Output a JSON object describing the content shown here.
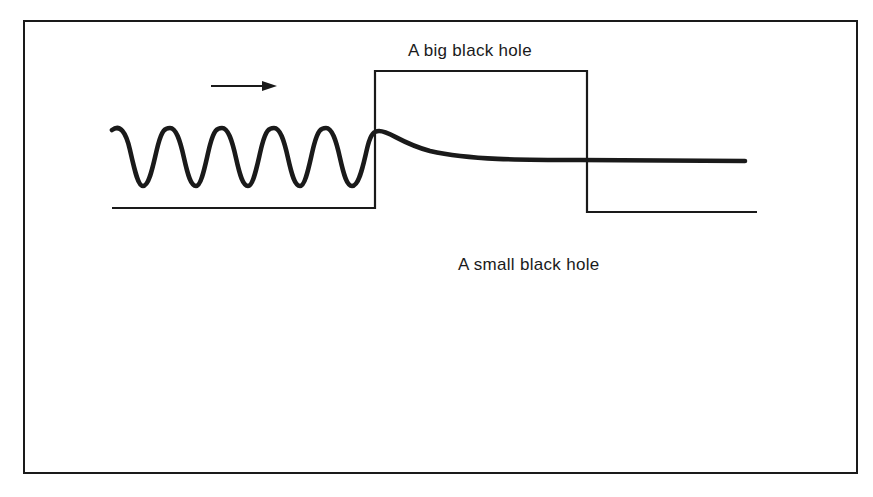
{
  "figure": {
    "type": "diagram",
    "colors": {
      "ink": "#1a1a1a",
      "background": "#ffffff"
    },
    "panels": [
      {
        "id": "big",
        "label": "A big black hole",
        "incoming_arrow": "right-arrow",
        "transmitted_arrow": null,
        "barrier": "wide-tall-barrier",
        "outcome": "wave absorbed; decays to flat line"
      },
      {
        "id": "small",
        "label": "A small black hole",
        "incoming_arrow": "right-arrow",
        "transmitted_arrow": "right-arrow",
        "barrier": "narrow-tall-barrier",
        "outcome": "small-amplitude wave transmitted (tunneling)"
      }
    ]
  }
}
